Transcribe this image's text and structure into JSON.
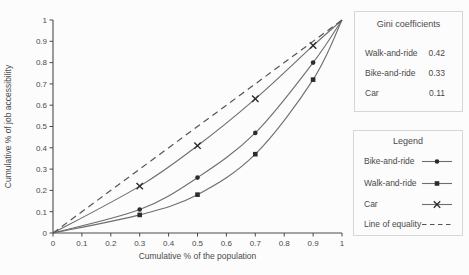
{
  "colors": {
    "axis": "#4a4a4a",
    "text": "#4a4a4a",
    "curve": "#6e6e6e",
    "marker": "#2c2c2c",
    "equality": "#555555",
    "panel_border": "#d6d6d6",
    "background": "#fcfcfc"
  },
  "chart_data": {
    "type": "line",
    "title": "",
    "xlabel": "Cumulative % of the population",
    "ylabel": "Cumulative % of job accessibility",
    "xlim": [
      0,
      1
    ],
    "ylim": [
      0,
      1
    ],
    "grid": false,
    "legend_position": "right-panel",
    "xticks": [
      0,
      0.1,
      0.2,
      0.3,
      0.4,
      0.5,
      0.6,
      0.7,
      0.8,
      0.9,
      1
    ],
    "yticks": [
      0,
      0.1,
      0.2,
      0.3,
      0.4,
      0.5,
      0.6,
      0.7,
      0.8,
      0.9,
      1
    ],
    "series": [
      {
        "name": "Bike-and-ride",
        "marker": "circle",
        "dashed": false,
        "x": [
          0,
          0.3,
          0.5,
          0.7,
          0.9,
          1
        ],
        "y": [
          0,
          0.11,
          0.26,
          0.47,
          0.8,
          1
        ]
      },
      {
        "name": "Walk-and-ride",
        "marker": "square",
        "dashed": false,
        "x": [
          0,
          0.3,
          0.5,
          0.7,
          0.9,
          1
        ],
        "y": [
          0,
          0.085,
          0.18,
          0.37,
          0.72,
          1
        ]
      },
      {
        "name": "Car",
        "marker": "x",
        "dashed": false,
        "x": [
          0,
          0.3,
          0.5,
          0.7,
          0.9,
          1
        ],
        "y": [
          0,
          0.22,
          0.41,
          0.63,
          0.88,
          1
        ]
      },
      {
        "name": "Line of equality",
        "marker": "none",
        "dashed": true,
        "x": [
          0,
          1
        ],
        "y": [
          0,
          1
        ]
      }
    ]
  },
  "gini_panel": {
    "title": "Gini coefficients",
    "rows": [
      {
        "label": "Walk-and-ride",
        "value": "0.42"
      },
      {
        "label": "Bike-and-ride",
        "value": "0.33"
      },
      {
        "label": "Car",
        "value": "0.11"
      }
    ]
  },
  "legend_panel": {
    "title": "Legend",
    "entries": [
      {
        "label": "Bike-and-ride",
        "marker": "circle"
      },
      {
        "label": "Walk-and-ride",
        "marker": "square"
      },
      {
        "label": "Car",
        "marker": "x"
      },
      {
        "label": "Line of equality",
        "marker": "dashed"
      }
    ]
  }
}
